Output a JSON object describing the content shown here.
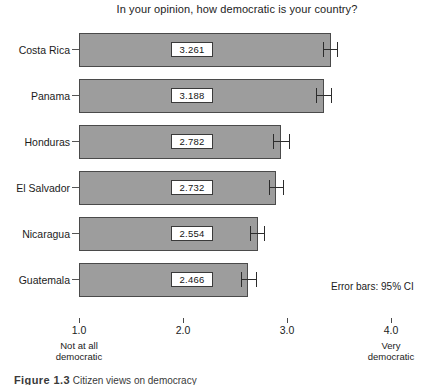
{
  "chart_data": {
    "type": "bar",
    "orientation": "horizontal",
    "title": "In your opinion, how democratic is your country?",
    "xlabel": "",
    "ylabel": "",
    "categories": [
      "Costa Rica",
      "Panama",
      "Honduras",
      "El Salvador",
      "Nicaragua",
      "Guatemala"
    ],
    "values": [
      3.261,
      3.188,
      2.782,
      2.732,
      2.554,
      2.466
    ],
    "value_labels": [
      "3.261",
      "3.188",
      "2.782",
      "2.732",
      "2.554",
      "2.466"
    ],
    "error_bars": {
      "note": "Error bars: 95% CI",
      "lower": [
        3.18,
        3.12,
        2.7,
        2.66,
        2.48,
        2.39
      ],
      "upper": [
        3.32,
        3.26,
        2.86,
        2.8,
        2.62,
        2.54
      ]
    },
    "xlim": [
      0.62,
      4.2
    ],
    "xticks": [
      1.0,
      2.0,
      3.0,
      4.0
    ],
    "xtick_labels": [
      "1.0",
      "2.0",
      "3.0",
      "4.0"
    ],
    "scale_anchor_low": "Not at all\ndemocratic",
    "scale_anchor_high": "Very\ndemocratic",
    "grid": false,
    "legend": "none",
    "bar_color": "#9d9d9d",
    "bar_edge_color": "#4a4a4a"
  },
  "axis": {
    "ticks": [
      {
        "label": "1.0",
        "value": 1.0
      },
      {
        "label": "2.0",
        "value": 2.0
      },
      {
        "label": "3.0",
        "value": 3.0
      },
      {
        "label": "4.0",
        "value": 4.0
      }
    ],
    "anchor_low_line1": "Not at all",
    "anchor_low_line2": "democratic",
    "anchor_high_line1": "Very",
    "anchor_high_line2": "democratic"
  },
  "notes": {
    "error_bars_note": "Error bars: 95% CI"
  },
  "caption": {
    "figure_number": "Figure 1.3",
    "text": "Citizen views on democracy"
  }
}
